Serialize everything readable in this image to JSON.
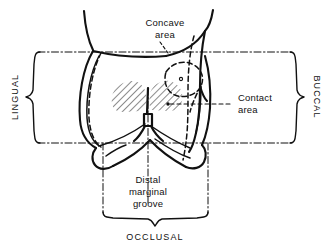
{
  "figure": {
    "ink_color": "#111111",
    "background_color": "#ffffff",
    "hatch_color": "#1a1a1a"
  },
  "callouts": {
    "concave": {
      "line1": "Concave",
      "line2": "area",
      "name": "Concave area"
    },
    "contact": {
      "line1": "Contact",
      "line2": "area",
      "name": "Contact area"
    },
    "groove": {
      "line1": "Distal",
      "line2": "marginal",
      "line3": "groove",
      "name": "Distal marginal groove"
    }
  },
  "axes": {
    "left": "LINGUAL",
    "right": "BUCCAL",
    "bottom": "OCCLUSAL"
  }
}
